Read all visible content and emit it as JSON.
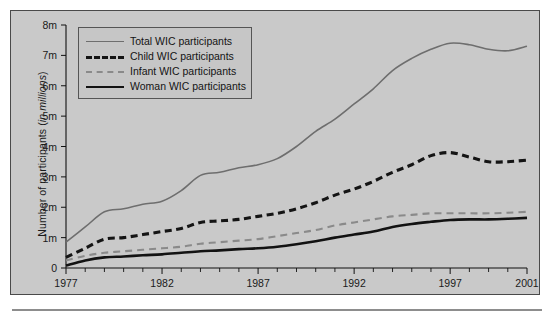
{
  "chart_data": {
    "type": "line",
    "title": "",
    "xlabel": "",
    "ylabel": "Number of participants (in millions)",
    "ylabel_plain": "Number of participants (",
    "ylabel_italic": "in millions",
    "ylabel_tail": ")",
    "xlim": [
      1977,
      2001
    ],
    "ylim": [
      0,
      8
    ],
    "grid": false,
    "legend_position": "top-left inside plot",
    "x": [
      1977,
      1978,
      1979,
      1980,
      1981,
      1982,
      1983,
      1984,
      1985,
      1986,
      1987,
      1988,
      1989,
      1990,
      1991,
      1992,
      1993,
      1994,
      1995,
      1996,
      1997,
      1998,
      1999,
      2000,
      2001
    ],
    "y_ticks": [
      0,
      1,
      2,
      3,
      4,
      5,
      6,
      7,
      8
    ],
    "y_tick_labels": [
      "0",
      "1m",
      "2m",
      "3m",
      "4m",
      "5m",
      "6m",
      "7m",
      "8m"
    ],
    "x_ticks": [
      1977,
      1978,
      1979,
      1980,
      1981,
      1982,
      1983,
      1984,
      1985,
      1986,
      1987,
      1988,
      1989,
      1990,
      1991,
      1992,
      1993,
      1994,
      1995,
      1996,
      1997,
      1998,
      1999,
      2000,
      2001
    ],
    "x_tick_labels_shown": [
      "1977",
      "1982",
      "1987",
      "1992",
      "1997",
      "2001"
    ],
    "x_labeled_years": [
      1977,
      1982,
      1987,
      1992,
      1997,
      2001
    ],
    "series": [
      {
        "name": "Total WIC participants",
        "style": "thin-gray-solid",
        "color": "#6e6e6e",
        "values": [
          0.85,
          1.35,
          1.85,
          1.95,
          2.1,
          2.2,
          2.55,
          3.05,
          3.15,
          3.3,
          3.4,
          3.6,
          4.0,
          4.5,
          4.9,
          5.4,
          5.9,
          6.5,
          6.9,
          7.2,
          7.4,
          7.35,
          7.2,
          7.15,
          7.3
        ]
      },
      {
        "name": "Child WIC participants",
        "style": "thick-black-dashed",
        "color": "#141414",
        "values": [
          0.35,
          0.65,
          0.95,
          1.0,
          1.1,
          1.2,
          1.3,
          1.5,
          1.55,
          1.6,
          1.7,
          1.8,
          1.95,
          2.15,
          2.4,
          2.6,
          2.85,
          3.15,
          3.4,
          3.7,
          3.8,
          3.65,
          3.5,
          3.5,
          3.55
        ]
      },
      {
        "name": "Infant WIC participants",
        "style": "thin-gray-dashed",
        "color": "#8a8a8a",
        "values": [
          0.25,
          0.4,
          0.5,
          0.55,
          0.6,
          0.65,
          0.7,
          0.8,
          0.85,
          0.9,
          0.95,
          1.05,
          1.15,
          1.25,
          1.4,
          1.5,
          1.6,
          1.7,
          1.75,
          1.8,
          1.8,
          1.8,
          1.8,
          1.82,
          1.85
        ]
      },
      {
        "name": "Woman WIC participants",
        "style": "thick-black-solid",
        "color": "#121212",
        "values": [
          0.08,
          0.25,
          0.35,
          0.38,
          0.42,
          0.45,
          0.5,
          0.55,
          0.58,
          0.62,
          0.65,
          0.7,
          0.78,
          0.88,
          1.0,
          1.1,
          1.2,
          1.35,
          1.45,
          1.52,
          1.58,
          1.6,
          1.6,
          1.62,
          1.65
        ]
      }
    ]
  },
  "legend": {
    "items": [
      {
        "label": "Total WIC participants",
        "swatch": "sw-total"
      },
      {
        "label": "Child WIC participants",
        "swatch": "sw-child"
      },
      {
        "label": "Infant WIC participants",
        "swatch": "sw-infant"
      },
      {
        "label": "Woman WIC participants",
        "swatch": "sw-woman"
      }
    ]
  }
}
